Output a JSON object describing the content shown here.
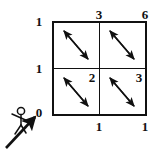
{
  "figure": {
    "line_color": "#111111",
    "label_color": "#111111",
    "background": "#ffffff"
  },
  "grid": {
    "rows": 2,
    "cols": 2,
    "bounds": {
      "left": 53,
      "top": 22,
      "right": 146,
      "bottom": 115
    },
    "mid_x": 99,
    "mid_y": 68
  },
  "labels": {
    "top_left_outside": "1",
    "top_mid": "3",
    "top_right": "6",
    "left_mid": "1",
    "left_bottom": "0",
    "cell_bottom_left_corner": "2",
    "cell_bottom_right_corner": "3",
    "bottom_mid": "1",
    "bottom_right": "1"
  },
  "cells": [
    {
      "id": "cell-top-left",
      "arrow": "double-headed-diagonal-nw-se"
    },
    {
      "id": "cell-top-right",
      "arrow": "double-headed-diagonal-nw-se"
    },
    {
      "id": "cell-bottom-left",
      "arrow": "double-headed-diagonal-nw-se",
      "corner_label": "2"
    },
    {
      "id": "cell-bottom-right",
      "arrow": "double-headed-diagonal-nw-se",
      "corner_label": "3"
    }
  ],
  "observer": {
    "icon": "stick-figure-icon",
    "arrow_icon": "view-direction-arrow-icon",
    "arrow_direction": "up-right",
    "origin_label": "0"
  }
}
